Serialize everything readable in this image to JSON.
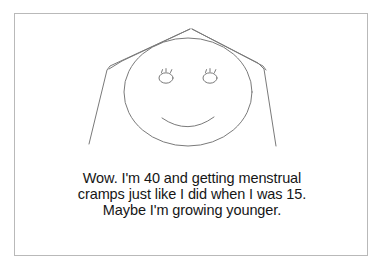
{
  "panel": {
    "name": "cartoon-panel",
    "background_color": "#ffffff",
    "border_color": "#b9b9b9"
  },
  "illustration": {
    "name": "line-drawing-woman-face",
    "description": "Simple line drawing of a smiling face with long straight hair",
    "stroke_color": "#7a7a7a",
    "parts": [
      {
        "name": "hair-outline",
        "label": "hair"
      },
      {
        "name": "face-oval",
        "label": "face"
      },
      {
        "name": "left-eye",
        "label": "left eye"
      },
      {
        "name": "right-eye",
        "label": "right eye"
      },
      {
        "name": "mouth-smile",
        "label": "smile"
      }
    ]
  },
  "caption": {
    "name": "caption",
    "text_color": "#161616",
    "lines": [
      "Wow. I'm 40 and getting menstrual",
      "cramps just like I did when I was 15.",
      "Maybe I'm growing younger."
    ],
    "full_text": "Wow. I'm 40 and getting menstrual cramps just like I did when I was 15. Maybe I'm growing younger."
  }
}
